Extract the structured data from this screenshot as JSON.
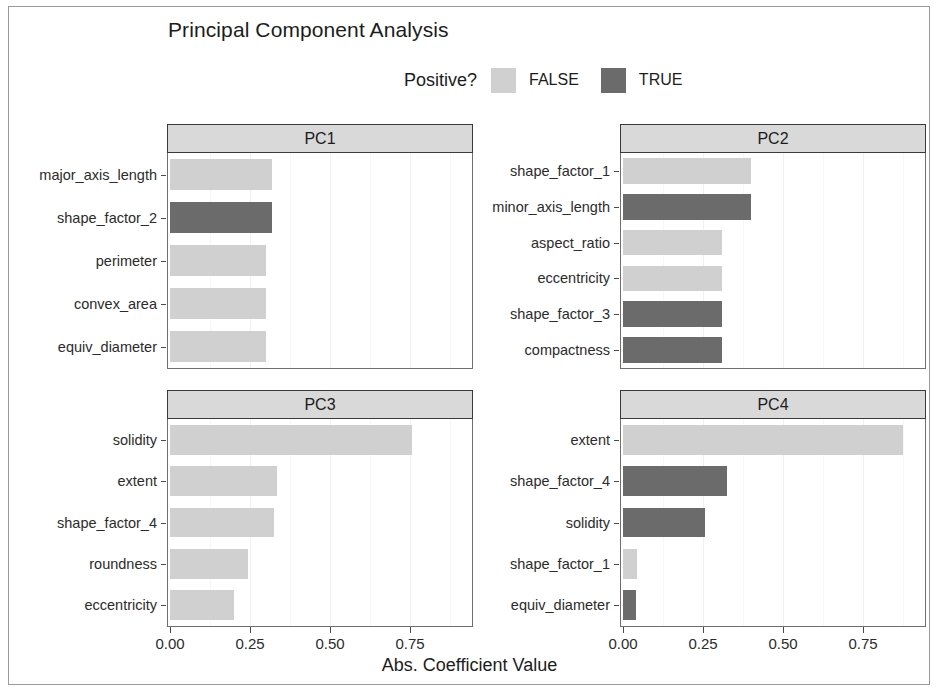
{
  "title": "Principal Component Analysis",
  "legend": {
    "title": "Positive?",
    "entries": [
      {
        "label": "FALSE",
        "color": "#d0d0d0",
        "icon": "legend-swatch-false"
      },
      {
        "label": "TRUE",
        "color": "#6b6b6b",
        "icon": "legend-swatch-true"
      }
    ]
  },
  "axis": {
    "xlabel": "Abs. Coefficient Value",
    "xticks": [
      "0.00",
      "0.25",
      "0.50",
      "0.75"
    ],
    "xtick_values": [
      0.0,
      0.25,
      0.5,
      0.75
    ],
    "xlim": [
      0,
      0.97
    ]
  },
  "colors": {
    "false_fill": "#d0d0d0",
    "true_fill": "#6b6b6b",
    "strip_fill": "#d9d9d9",
    "panel_border": "#6f6f6f",
    "strip_border": "#3a3a3a",
    "grid": "#f1f1f1",
    "text": "#1c1c1c"
  },
  "chart_data": {
    "type": "bar",
    "orientation": "horizontal",
    "title": "Principal Component Analysis",
    "xlabel": "Abs. Coefficient Value",
    "ylabel": "",
    "xlim": [
      0,
      0.97
    ],
    "grid": true,
    "legend_position": "top",
    "legend_title": "Positive?",
    "legend_entries": [
      "FALSE",
      "TRUE"
    ],
    "facets": [
      {
        "name": "PC1",
        "categories": [
          "major_axis_length",
          "shape_factor_2",
          "perimeter",
          "convex_area",
          "equiv_diameter"
        ],
        "values": [
          0.32,
          0.32,
          0.3,
          0.3,
          0.3
        ],
        "positive": [
          false,
          true,
          false,
          false,
          false
        ]
      },
      {
        "name": "PC2",
        "categories": [
          "shape_factor_1",
          "minor_axis_length",
          "aspect_ratio",
          "eccentricity",
          "shape_factor_3",
          "compactness"
        ],
        "values": [
          0.4,
          0.4,
          0.31,
          0.31,
          0.31,
          0.31
        ],
        "positive": [
          false,
          true,
          false,
          false,
          true,
          true
        ]
      },
      {
        "name": "PC3",
        "categories": [
          "solidity",
          "extent",
          "shape_factor_4",
          "roundness",
          "eccentricity"
        ],
        "values": [
          0.755,
          0.335,
          0.325,
          0.245,
          0.2
        ],
        "positive": [
          false,
          false,
          false,
          false,
          false
        ]
      },
      {
        "name": "PC4",
        "categories": [
          "extent",
          "shape_factor_4",
          "solidity",
          "shape_factor_1",
          "equiv_diameter"
        ],
        "values": [
          0.875,
          0.325,
          0.255,
          0.045,
          0.04
        ],
        "positive": [
          false,
          true,
          true,
          false,
          true
        ]
      }
    ]
  }
}
